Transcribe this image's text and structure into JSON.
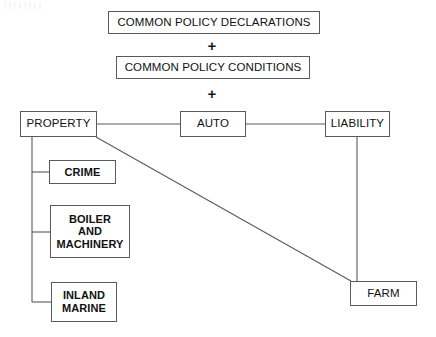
{
  "diagram": {
    "line_color": "#5a5a5a",
    "text_color": "#111111",
    "background": "#ffffff",
    "operators": [
      {
        "name": "plus-1",
        "symbol": "+"
      },
      {
        "name": "plus-2",
        "symbol": "+"
      }
    ],
    "nodes": {
      "common_policy_declarations": {
        "label": "COMMON POLICY DECLARATIONS"
      },
      "common_policy_conditions": {
        "label": "COMMON POLICY CONDITIONS"
      },
      "property": {
        "label": "PROPERTY"
      },
      "auto": {
        "label": "AUTO"
      },
      "liability": {
        "label": "LIABILITY"
      },
      "crime": {
        "label": "CRIME"
      },
      "boiler_and_machinery": {
        "label": "BOILER\nAND\nMACHINERY"
      },
      "inland_marine": {
        "label": "INLAND\nMARINE"
      },
      "farm": {
        "label": "FARM"
      }
    }
  }
}
